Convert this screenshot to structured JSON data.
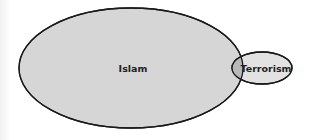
{
  "diagram": {
    "type": "venn",
    "sets": [
      {
        "label": "Islam",
        "fill": "#d6d6d6",
        "stroke": "#1a1a1a"
      },
      {
        "label": "Terrorism",
        "fill": "#e0e0e0",
        "stroke": "#1a1a1a"
      }
    ],
    "overlap_fill": "#b8b8b8"
  }
}
